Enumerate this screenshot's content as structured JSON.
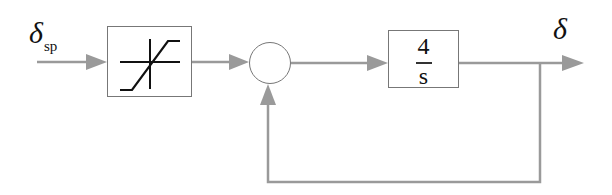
{
  "diagram": {
    "type": "feedback-block-diagram",
    "input": {
      "symbol": "δ",
      "subscript": "sp"
    },
    "output": {
      "symbol": "δ"
    },
    "blocks": [
      {
        "id": "saturation",
        "kind": "saturation-nonlinearity"
      },
      {
        "id": "summing-junction",
        "kind": "sum"
      },
      {
        "id": "integrator",
        "kind": "transfer-function",
        "numerator": "4",
        "denominator": "s"
      }
    ],
    "feedback": {
      "from": "output",
      "to": "summing-junction",
      "path": "unity"
    }
  },
  "colors": {
    "line": "#999999",
    "arrow": "#999999",
    "block_border": "#777777",
    "text": "#111111",
    "saturation_glyph": "#111111"
  }
}
